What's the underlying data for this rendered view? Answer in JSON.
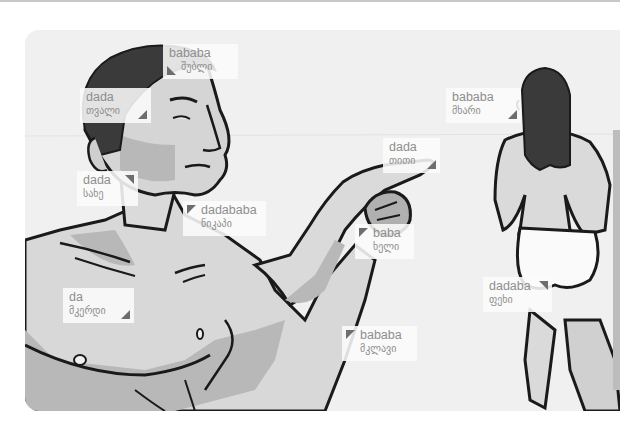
{
  "illustration": {
    "description": "Anatomy vocabulary illustration: man pointing, woman seen from behind",
    "colors": {
      "panel_bg": "#f0f0f0",
      "skin_light": "#dcdcdc",
      "skin_shadow": "#b4b4b4",
      "hair": "#3a3a3a",
      "outline": "#1a1a1a",
      "label_text": "#8e8e8e",
      "marker": "#6d6d6d"
    }
  },
  "labels": [
    {
      "id": "hair",
      "en": "bababa",
      "ka": "თმა/შუბლი",
      "ka_display": "შუბლი",
      "marker": "bottom-left"
    },
    {
      "id": "eye",
      "en": "dada",
      "ka_display": "თვალი",
      "marker": "bottom-right"
    },
    {
      "id": "face",
      "en": "dada",
      "ka_display": "სახე",
      "marker": "top-right"
    },
    {
      "id": "neck",
      "en": "dadababa",
      "ka_display": "ნიკაპი",
      "marker": "top-left"
    },
    {
      "id": "chest",
      "en": "da",
      "ka_display": "მკერდი",
      "marker": "bottom-right"
    },
    {
      "id": "finger",
      "en": "dada",
      "ka_display": "თითი",
      "marker": "bottom-right"
    },
    {
      "id": "hand",
      "en": "baba",
      "ka_display": "ხელი",
      "marker": "top-left"
    },
    {
      "id": "arm",
      "en": "bababa",
      "ka_display": "მკლავი",
      "marker": "top-left"
    },
    {
      "id": "shoulder",
      "en": "bababa",
      "ka_display": "მხარი",
      "marker": "bottom-right"
    },
    {
      "id": "leg",
      "en": "dadaba",
      "ka_display": "ფეხი",
      "marker": "top-right"
    }
  ]
}
